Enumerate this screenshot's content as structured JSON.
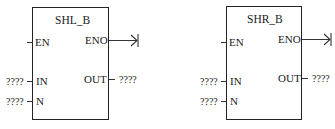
{
  "blocks": [
    {
      "title": "SHL_B",
      "inputs": {
        "en": "EN",
        "in": "IN",
        "n": "N"
      },
      "outputs": {
        "eno": "ENO",
        "out": "OUT"
      },
      "in_value": "????",
      "n_value": "????",
      "out_value": "????"
    },
    {
      "title": "SHR_B",
      "inputs": {
        "en": "EN",
        "in": "IN",
        "n": "N"
      },
      "outputs": {
        "eno": "ENO",
        "out": "OUT"
      },
      "in_value": "????",
      "n_value": "????",
      "out_value": "????"
    }
  ]
}
